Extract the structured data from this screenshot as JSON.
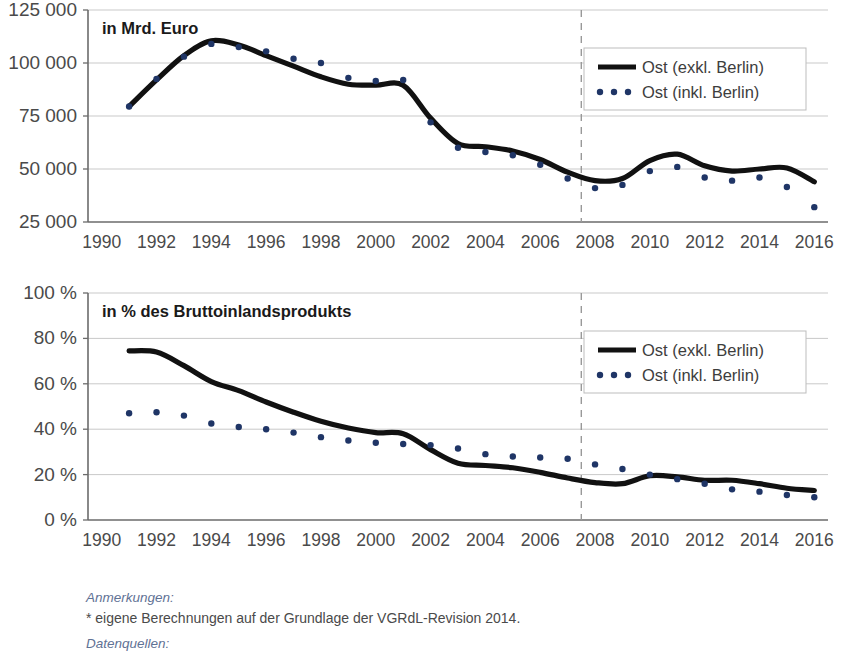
{
  "series_colors": {
    "exkl": "#111111",
    "inkl": "#1f3566",
    "grid": "#c9c9c9",
    "axis": "#6b6b6b",
    "marker_line": "#999999",
    "note_heading": "#5f7295"
  },
  "legend": {
    "exkl_label": "Ost (exkl. Berlin)",
    "inkl_label": "Ost (inkl. Berlin)"
  },
  "footer": {
    "notes_heading": "Anmerkungen:",
    "notes_line": "* eigene Berechnungen auf der Grundlage der VGRdL-Revision 2014.",
    "sources_heading": "Datenquellen:"
  },
  "chart_data": [
    {
      "id": "top",
      "type": "line",
      "title": "",
      "inset_label": "in Mrd. Euro",
      "xlabel": "",
      "ylabel": "",
      "grid": true,
      "legend_position": "top-right",
      "xlim": [
        1989.5,
        2016.5
      ],
      "ylim": [
        25000,
        125000
      ],
      "yticks": [
        25000,
        50000,
        75000,
        100000,
        125000
      ],
      "yticklabels": [
        "25 000",
        "50 000",
        "75 000",
        "100 000",
        "125 000"
      ],
      "xticks": [
        1990,
        1992,
        1994,
        1996,
        1998,
        2000,
        2002,
        2004,
        2006,
        2008,
        2010,
        2012,
        2014,
        2016
      ],
      "xticklabels": [
        "1990",
        "1992",
        "1994",
        "1996",
        "1998",
        "2000",
        "2002",
        "2004",
        "2006",
        "2008",
        "2010",
        "2012",
        "2014",
        "2016"
      ],
      "annotation_vline": 2007.5,
      "x": [
        1991,
        1992,
        1993,
        1994,
        1995,
        1996,
        1997,
        1998,
        1999,
        2000,
        2001,
        2002,
        2003,
        2004,
        2005,
        2006,
        2007,
        2008,
        2009,
        2010,
        2011,
        2012,
        2013,
        2014,
        2015,
        2016
      ],
      "series": [
        {
          "name": "Ost (exkl. Berlin)",
          "style": "solid",
          "values": [
            79500,
            92000,
            103500,
            110500,
            108500,
            103500,
            98500,
            93500,
            90000,
            89500,
            89500,
            74000,
            62000,
            60500,
            58500,
            54500,
            48500,
            44500,
            45500,
            54000,
            57000,
            51500,
            49000,
            50000,
            50500,
            44000
          ]
        },
        {
          "name": "Ost (inkl. Berlin)",
          "style": "dotted",
          "values": [
            79500,
            92500,
            103000,
            109000,
            107500,
            105500,
            102000,
            100000,
            93000,
            91500,
            92000,
            72000,
            60000,
            58000,
            56500,
            52000,
            45500,
            41000,
            42500,
            49000,
            51000,
            46000,
            44500,
            46000,
            41500,
            32000
          ]
        }
      ]
    },
    {
      "id": "bottom",
      "type": "line",
      "title": "",
      "inset_label": "in % des Bruttoinlandsprodukts",
      "xlabel": "",
      "ylabel": "",
      "grid": true,
      "legend_position": "top-right",
      "xlim": [
        1989.5,
        2016.5
      ],
      "ylim": [
        0,
        100
      ],
      "yticks": [
        0,
        20,
        40,
        60,
        80,
        100
      ],
      "yticklabels": [
        "0 %",
        "20 %",
        "40 %",
        "60 %",
        "80 %",
        "100 %"
      ],
      "xticks": [
        1990,
        1992,
        1994,
        1996,
        1998,
        2000,
        2002,
        2004,
        2006,
        2008,
        2010,
        2012,
        2014,
        2016
      ],
      "xticklabels": [
        "1990",
        "1992",
        "1994",
        "1996",
        "1998",
        "2000",
        "2002",
        "2004",
        "2006",
        "2008",
        "2010",
        "2012",
        "2014",
        "2016"
      ],
      "annotation_vline": 2007.5,
      "x": [
        1991,
        1992,
        1993,
        1994,
        1995,
        1996,
        1997,
        1998,
        1999,
        2000,
        2001,
        2002,
        2003,
        2004,
        2005,
        2006,
        2007,
        2008,
        2009,
        2010,
        2011,
        2012,
        2013,
        2014,
        2015,
        2016
      ],
      "series": [
        {
          "name": "Ost (exkl. Berlin)",
          "style": "solid",
          "values": [
            74.5,
            74.0,
            68.0,
            61.0,
            57.0,
            52.0,
            47.5,
            43.5,
            40.5,
            38.5,
            38.0,
            31.0,
            25.0,
            24.0,
            23.0,
            21.0,
            18.5,
            16.5,
            16.0,
            19.5,
            19.0,
            17.5,
            17.5,
            16.0,
            14.0,
            13.0
          ]
        },
        {
          "name": "Ost (inkl. Berlin)",
          "style": "dotted",
          "values": [
            47.0,
            47.5,
            46.0,
            42.5,
            41.0,
            40.0,
            38.5,
            36.5,
            35.0,
            34.0,
            33.5,
            33.0,
            31.5,
            29.0,
            28.0,
            27.5,
            27.0,
            24.5,
            22.5,
            20.0,
            18.0,
            16.0,
            13.5,
            12.5,
            11.0,
            10.0
          ]
        }
      ]
    }
  ]
}
